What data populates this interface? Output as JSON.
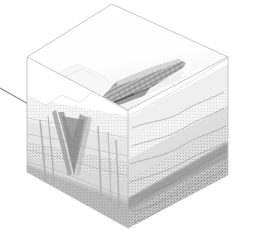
{
  "figure": {
    "background_color": "#ffffff",
    "width": 262,
    "height": 249
  },
  "geometry": {
    "block_vertices": {
      "top_back": [
        112,
        4
      ],
      "top_left": [
        27,
        57
      ],
      "top_right": [
        228,
        57
      ],
      "top_front": [
        128,
        110
      ],
      "bottom_left": [
        27,
        172
      ],
      "bottom_right": [
        228,
        175
      ],
      "bottom_front": [
        128,
        228
      ]
    },
    "wireframe_color": "#b9b9b9",
    "wireframe_width": 0.8
  },
  "leader_line": {
    "name": "callout-leader-line",
    "start": [
      0,
      88
    ],
    "end": [
      30,
      105
    ],
    "color": "#8a8a90",
    "width": 1.1
  },
  "surfaces": {
    "top_face_label": "Map surface (topography)",
    "left_face_label": "Left cross-section",
    "right_face_label": "Right cross-section"
  },
  "terrain": {
    "ridge": {
      "name": "escarpment-ridge",
      "description": "Elongated dissected ridge crest trending from lower-left to upper-right across the plateau surface",
      "crest_shade": "#9a9a9a",
      "gully_count": 22,
      "shadow_shade": "#6f6f6f"
    },
    "canyon": {
      "name": "incised-canyon",
      "description": "Deep V-shaped valley incised into the left cross-section face",
      "wall_shade": "#9c9c9c",
      "floor_shade": "#7e7e7e"
    },
    "mesa": {
      "name": "mesa-plateau",
      "description": "Light-toned flat upland surface west of the ridge",
      "shade": "#f2f2f2"
    }
  },
  "strata": {
    "left_face_layers": [
      {
        "name": "upper-slope-unit",
        "color": "#ededed",
        "thickness": 0.26
      },
      {
        "name": "mid-slope-unit",
        "color": "#dcdcdc",
        "thickness": 0.22
      },
      {
        "name": "resistant-ledge-unit",
        "color": "#c2c2c2",
        "thickness": 0.16
      },
      {
        "name": "lower-slope-unit",
        "color": "#d4d4d4",
        "thickness": 0.2
      },
      {
        "name": "basal-unit",
        "color": "#bdbdbd",
        "thickness": 0.16
      }
    ],
    "right_face_layers": [
      {
        "name": "surface-unit",
        "color": "#f0f0f0",
        "thickness": 0.18
      },
      {
        "name": "upper-sandstone",
        "color": "#e4e4e4",
        "thickness": 0.16
      },
      {
        "name": "middle-shale",
        "color": "#d6d6d6",
        "thickness": 0.16
      },
      {
        "name": "lower-sandstone",
        "color": "#c4c4c4",
        "thickness": 0.15
      },
      {
        "name": "dark-marker-bed",
        "color": "#a8a8a8",
        "thickness": 0.14
      },
      {
        "name": "basement-unit",
        "color": "#b4b4b4",
        "thickness": 0.21
      }
    ],
    "bedding_trace_color": "#8e8e8e",
    "bedding_trace_count": 7,
    "dip_direction": "gently dipping to the right (east)"
  },
  "palette": {
    "outline": "#b9b9b9",
    "lightest": "#f6f6f6",
    "light": "#e4e4e4",
    "mid": "#c2c2c2",
    "dark": "#9a9a9a",
    "darkest": "#6f6f6f",
    "background": "#ffffff"
  }
}
